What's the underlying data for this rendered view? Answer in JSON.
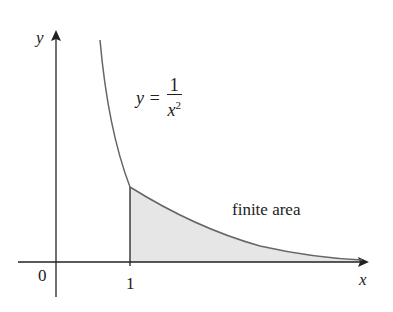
{
  "diagram": {
    "axis_labels": {
      "y": "y",
      "x": "x"
    },
    "tick_labels": {
      "origin": "0",
      "one": "1"
    },
    "equation": {
      "lhs": "y =",
      "numerator": "1",
      "denominator": "x",
      "exponent": "2"
    },
    "region_label": "finite area",
    "colors": {
      "curve": "#666666",
      "axes": "#222222",
      "fill": "#e6e6e6"
    }
  }
}
